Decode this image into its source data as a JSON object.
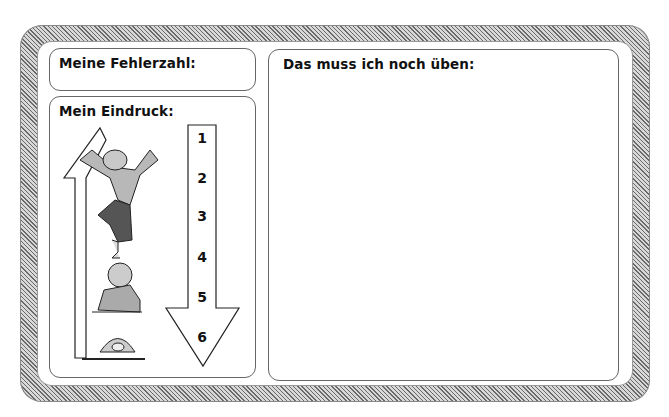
{
  "worksheet": {
    "error_count": {
      "label": "Meine Fehlerzahl:",
      "value": ""
    },
    "impression": {
      "label": "Mein Eindruck:",
      "scale": [
        "1",
        "2",
        "3",
        "4",
        "5",
        "6"
      ],
      "illustrations": [
        "cheering-man-icon",
        "phoning-man-icon",
        "hiding-man-icon"
      ]
    },
    "practice": {
      "label": "Das muss ich noch üben:",
      "value": ""
    }
  }
}
